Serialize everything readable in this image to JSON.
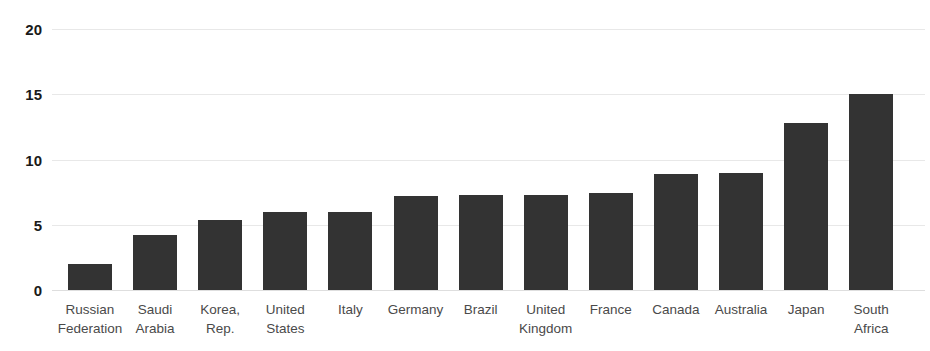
{
  "chart_data": {
    "type": "bar",
    "title": "",
    "subtitle": "",
    "xlabel": "",
    "ylabel": "",
    "ylim": [
      0,
      20
    ],
    "yticks": [
      0,
      5,
      10,
      15,
      20
    ],
    "ytick_labels": [
      "0",
      "5",
      "10",
      "15",
      "20"
    ],
    "grid": true,
    "legend": false,
    "legend_position": "none",
    "orientation": "vertical",
    "bar_color": "#333333",
    "gridline_color": "#e8e8e8",
    "categories": [
      "Russian Federation",
      "Saudi Arabia",
      "Korea, Rep.",
      "United States",
      "Italy",
      "Germany",
      "Brazil",
      "United Kingdom",
      "France",
      "Canada",
      "Australia",
      "Japan",
      "South Africa"
    ],
    "category_lines": [
      [
        "Russian",
        "Federation"
      ],
      [
        "Saudi",
        "Arabia"
      ],
      [
        "Korea,",
        "Rep."
      ],
      [
        "United",
        "States"
      ],
      [
        "Italy"
      ],
      [
        "Germany"
      ],
      [
        "Brazil"
      ],
      [
        "United",
        "Kingdom"
      ],
      [
        "France"
      ],
      [
        "Canada"
      ],
      [
        "Australia"
      ],
      [
        "Japan"
      ],
      [
        "South",
        "Africa"
      ]
    ],
    "values": [
      2.0,
      4.2,
      5.4,
      6.0,
      6.0,
      7.2,
      7.3,
      7.3,
      7.4,
      8.9,
      9.0,
      12.8,
      15.0
    ],
    "series": [
      {
        "name": "",
        "values": [
          2.0,
          4.2,
          5.4,
          6.0,
          6.0,
          7.2,
          7.3,
          7.3,
          7.4,
          8.9,
          9.0,
          12.8,
          15.0
        ]
      }
    ]
  }
}
